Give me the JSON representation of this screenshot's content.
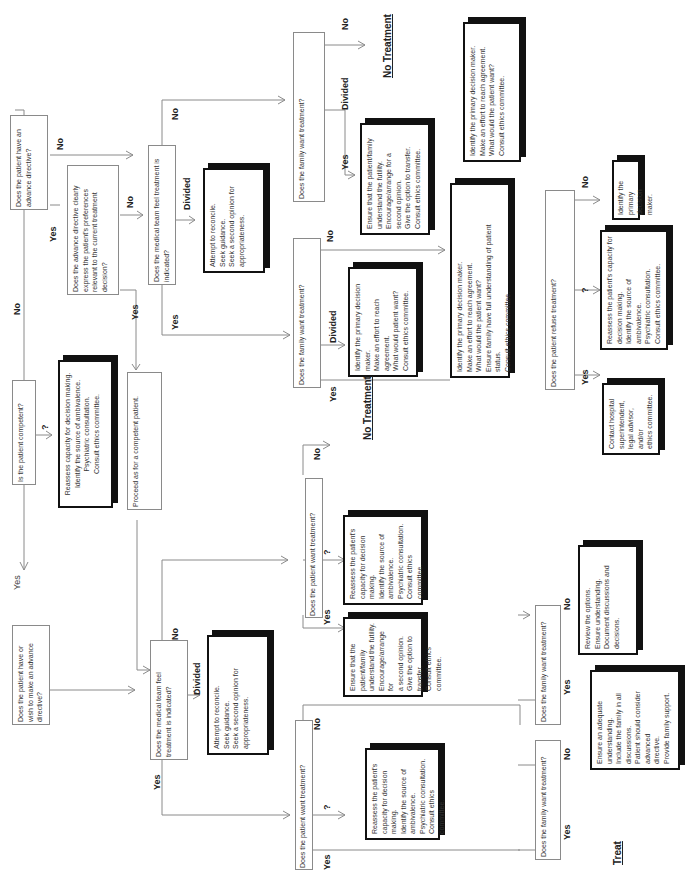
{
  "diagram": {
    "orientation": "rotated 90 degrees counterclockwise",
    "questions": {
      "competent": "Is the patient competent?",
      "has_directive": "Does the patient have an advance directive?",
      "directive_clear": "Does the advance directive clearly express the patient's preferences relevant to the current treatment decision?",
      "team_indicated_top": "Does the medical team feel treatment is indicated?",
      "family_want_top_no": "Does the family want treatment?",
      "family_want_top_yes": "Does the family want treatment?",
      "patient_refuse": "Does the patient refuse treatment?",
      "wish_directive": "Does the patient have or wish to make an advance directive?",
      "team_indicated_bottom": "Does the medical team feel treatment is indicated?",
      "patient_want_upper": "Does the patient want treatment?",
      "patient_want_lower": "Does the patient want treatment?",
      "family_want_bottom_a": "Does the family want treatment?",
      "family_want_bottom_b": "Does the family want treatment?"
    },
    "actions": {
      "reassess_incompetent": "Reassess capacity for decision making.\nIdentify the source of ambivalence.\nPsychiatric consultation.\nConsult ethics committee.",
      "proceed_competent": "Proceed as for a competent patient.",
      "reconcile_top": "Attempt to reconcile.\nSeek guidance.\nSeek a second opinion for\nappropriateness.",
      "ensure_futility_top": "Ensure that the patient/family\nunderstand the futility.\nEncourage/arrange for a\nsecond opinion.\nGive the option to transfer.\nConsult ethics committee.",
      "identify_pdm_top": "Identify the primary decision maker.\nMake an effort to reach agreement.\nWhat would the patient want?\nConsult ethics committee.",
      "identify_pdm_divided": "Identify the primary decision\nmaker.\nMake an effort to reach\nagreement.\nWhat would patient want?\nConsult ethics committee.",
      "identify_pdm_status": "Identify the primary decision maker.\nMake an effort to reach agreement.\nWhat would the patient want?\nEnsure family have full understanding of patient\nstatus.\nConsult ethics committee.",
      "identify_pdm_short": "Identify the primary decision\nmaker.",
      "reassess_refuse": "Reassess the patient's capacity for\ndecision making.\nIdentify the source of ambivalence.\nPsychiatric consultation.\nConsult ethics committee.",
      "contact_hospital": "Contact hospital\nsuperintendent,\nlegal advisor, and/or\nethics committee.",
      "reconcile_bottom": "Attempt to reconcile.\nSeek guidance.\nSeek a second opinion for\nappropriateness.",
      "reassess_upper": "Reassess the patient's\ncapacity for decision\nmaking.\nIdentify the source of\nambivalence.\nPsychiatric consultation.\nConsult ethics\ncommittee.",
      "ensure_futility_bottom": "Ensure that the\npatient/family\nunderstand the futility.\nEncourage/arrange for\na second opinion.\nGive the option to\ntransfer.\nConsult ethics\ncommittee.",
      "reassess_lower": "Reassess the patient's\ncapacity for decision\nmaking.\nIdentify the source of\nambivalence.\nPsychiatric consultation.\nConsult ethics committee.",
      "review_options": "Review the options.\nEnsure understanding.\nDocument discussions and decisions.",
      "ensure_understanding": "Ensure an adequate\nunderstanding.\nInclude the family in all discussions.\nPatient should consider advanced\ndirective.\nProvide family support."
    },
    "outcomes": {
      "no_treatment_top": "No  Treatment",
      "no_treatment_mid": "No Treatment",
      "treat": "Treat"
    },
    "labels": {
      "yes": "Yes",
      "no": "No",
      "divided": "Divided",
      "unsure": "?"
    },
    "colors": {
      "line": "#8a8a8a",
      "action_border": "#111111",
      "question_border": "#8a8a8a"
    }
  }
}
